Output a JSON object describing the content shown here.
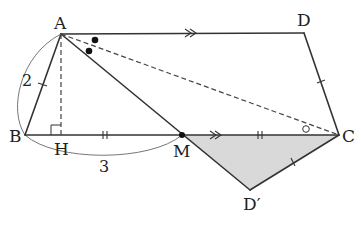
{
  "figure": {
    "type": "geometry",
    "points": {
      "A": {
        "label": "A",
        "x": 61,
        "y": 34
      },
      "D": {
        "label": "D",
        "x": 304,
        "y": 33
      },
      "B": {
        "label": "B",
        "x": 25,
        "y": 135
      },
      "H": {
        "label": "H",
        "x": 60,
        "y": 135
      },
      "M": {
        "label": "M",
        "x": 182,
        "y": 135
      },
      "C": {
        "label": "C",
        "x": 339,
        "y": 135
      },
      "D_prime": {
        "label": "D′",
        "x": 250,
        "y": 190
      }
    },
    "measurements": {
      "AB": "2",
      "BM": "3"
    },
    "colors": {
      "line": "#333333",
      "shade": "#d9d9d9",
      "background": "#ffffff"
    }
  }
}
